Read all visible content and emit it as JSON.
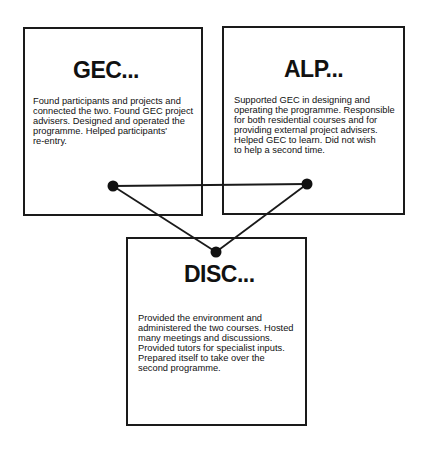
{
  "diagram": {
    "nodes": [
      {
        "id": "gec",
        "title": "GEC...",
        "body": "Found participants and projects and\nconnected the two. Found GEC project\nadvisers. Designed and operated the\nprogramme. Helped participants'\nre-entry."
      },
      {
        "id": "alp",
        "title": "ALP...",
        "body": "Supported GEC in designing and\noperating the programme. Responsible\nfor both residential courses and for\nproviding external project advisers.\nHelped GEC to learn. Did not wish\nto help a second time."
      },
      {
        "id": "disc",
        "title": "DISC...",
        "body": "Provided the environment and\nadministered the two courses. Hosted\nmany meetings and discussions.\nProvided tutors for specialist inputs.\nPrepared itself to take over the\nsecond programme."
      }
    ],
    "connections": [
      {
        "from": "gec",
        "to": "alp"
      },
      {
        "from": "gec",
        "to": "disc"
      },
      {
        "from": "alp",
        "to": "disc"
      }
    ],
    "colors": {
      "line": "#1a1a1a",
      "dot": "#111111",
      "background": "#ffffff"
    }
  }
}
